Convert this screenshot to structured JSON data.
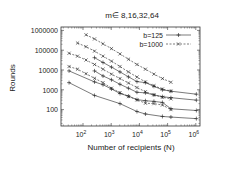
{
  "chart_data": {
    "type": "line",
    "title": "m∈ 8,16,32,64",
    "xlabel": "Number of recipients (N)",
    "ylabel": "Rounds",
    "xscale": "log",
    "yscale": "log",
    "xlim": [
      17,
      1400000
    ],
    "ylim": [
      15,
      1500000
    ],
    "x_ticks": [
      {
        "v": 100,
        "label": "10",
        "exp": "2"
      },
      {
        "v": 1000,
        "label": "10",
        "exp": "3"
      },
      {
        "v": 10000,
        "label": "10",
        "exp": "4"
      },
      {
        "v": 100000,
        "label": "10",
        "exp": "5"
      },
      {
        "v": 1000000,
        "label": "10",
        "exp": "6"
      }
    ],
    "y_ticks": [
      {
        "v": 100,
        "label": "100"
      },
      {
        "v": 1000,
        "label": "1000"
      },
      {
        "v": 10000,
        "label": "10000"
      },
      {
        "v": 100000,
        "label": "100000"
      },
      {
        "v": 1000000,
        "label": "1000000"
      }
    ],
    "grid": false,
    "legend_position": "upper right",
    "legend": [
      {
        "label": "b=125",
        "style": "solid",
        "marker": "+"
      },
      {
        "label": "b=1000",
        "style": "dashed",
        "marker": "x"
      }
    ],
    "series": [
      {
        "name": "b=1000",
        "group": "dashed",
        "x": [
          128,
          256,
          512,
          1024,
          2048,
          4096,
          8192,
          16384,
          32768,
          65536,
          131072
        ],
        "values": [
          600000,
          370000,
          210000,
          120000,
          65000,
          35000,
          19000,
          11000,
          6200,
          3700,
          2400
        ]
      },
      {
        "name": "b=1000",
        "group": "dashed",
        "x": [
          64,
          128,
          256,
          512,
          1024,
          2048,
          4096,
          8192,
          16384,
          32768,
          65536,
          131072
        ],
        "values": [
          230000,
          150000,
          90000,
          50000,
          28000,
          15000,
          8000,
          4400,
          2500,
          1600,
          1100,
          850
        ]
      },
      {
        "name": "b=1000",
        "group": "dashed",
        "x": [
          32,
          64,
          128,
          256,
          512,
          1024,
          2048,
          4096,
          8192,
          16384,
          32768,
          65536,
          131072
        ],
        "values": [
          70000,
          50000,
          32000,
          19000,
          11000,
          6200,
          3700,
          2200,
          1300,
          800,
          560,
          420,
          350
        ]
      },
      {
        "name": "b=1000",
        "group": "dashed",
        "x": [
          32,
          64,
          128,
          256,
          512,
          1024,
          2048,
          4096,
          8192,
          16384,
          32768,
          65536,
          131072
        ],
        "values": [
          15000,
          11000,
          6500,
          3800,
          2300,
          1200,
          720,
          460,
          310,
          210,
          200,
          170,
          100
        ]
      },
      {
        "name": "b=125",
        "group": "solid",
        "x": [
          256,
          512,
          1024,
          2048,
          4096,
          8192,
          16384,
          32768,
          65536,
          131072,
          1048576
        ],
        "values": [
          42000,
          24000,
          14000,
          8000,
          4500,
          2600,
          2300,
          1500,
          1000,
          850,
          600
        ]
      },
      {
        "name": "b=125",
        "group": "solid",
        "x": [
          256,
          512,
          1024,
          2048,
          4096,
          8192,
          16384,
          32768,
          65536,
          131072,
          1048576
        ],
        "values": [
          9000,
          5000,
          3200,
          1900,
          1200,
          750,
          700,
          550,
          450,
          400,
          300
        ]
      },
      {
        "name": "b=125",
        "group": "solid",
        "x": [
          32,
          256,
          512,
          1024,
          2048,
          4096,
          8192,
          16384,
          32768,
          65536,
          131072,
          1048576
        ],
        "values": [
          9000,
          2500,
          1800,
          1100,
          650,
          480,
          320,
          280,
          260,
          230,
          110,
          90
        ]
      },
      {
        "name": "b=125",
        "group": "solid",
        "x": [
          32,
          256,
          2048,
          8192,
          16384,
          65536,
          131072,
          1048576
        ],
        "values": [
          2300,
          520,
          200,
          80,
          60,
          45,
          42,
          35
        ]
      }
    ]
  }
}
